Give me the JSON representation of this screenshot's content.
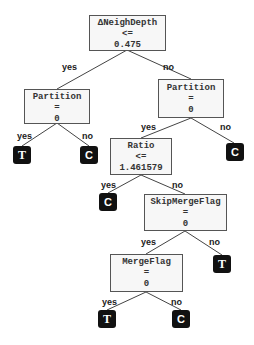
{
  "diagram": {
    "type": "decision-tree",
    "nodes": [
      {
        "id": "root",
        "feature": "ΔNeighDepth",
        "op": "<=",
        "value": "0.475"
      },
      {
        "id": "left_partition",
        "feature": "Partition",
        "op": "=",
        "value": "0"
      },
      {
        "id": "right_partition",
        "feature": "Partition",
        "op": "=",
        "value": "0"
      },
      {
        "id": "ratio",
        "feature": "Ratio",
        "op": "<=",
        "value": "1.461579"
      },
      {
        "id": "skip_merge",
        "feature": "SkipMergeFlag",
        "op": "=",
        "value": "0"
      },
      {
        "id": "merge_flag",
        "feature": "MergeFlag",
        "op": "=",
        "value": "0"
      }
    ],
    "leaves": [
      {
        "id": "leaf1",
        "label": "T"
      },
      {
        "id": "leaf2",
        "label": "C"
      },
      {
        "id": "leaf3",
        "label": "C"
      },
      {
        "id": "leaf4",
        "label": "C"
      },
      {
        "id": "leaf5",
        "label": "T"
      },
      {
        "id": "leaf6",
        "label": "T"
      },
      {
        "id": "leaf7",
        "label": "C"
      }
    ],
    "edge_labels": {
      "yes": "yes",
      "no": "no"
    },
    "colors": {
      "node_fill": "#f7f7f7",
      "node_border": "#555555",
      "leaf_fill": "#111111",
      "leaf_text": "#ffffff",
      "edge": "#444444"
    }
  }
}
